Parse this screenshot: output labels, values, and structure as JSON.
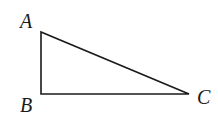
{
  "diagram": {
    "type": "right-triangle",
    "stroke_color": "#1a1a1a",
    "vertices": [
      {
        "id": "A",
        "label": "A",
        "x": 41,
        "y": 32,
        "label_x": 20,
        "label_y": 28
      },
      {
        "id": "B",
        "label": "B",
        "x": 41,
        "y": 94,
        "label_x": 20,
        "label_y": 112
      },
      {
        "id": "C",
        "label": "C",
        "x": 189,
        "y": 94,
        "label_x": 197,
        "label_y": 104
      }
    ],
    "edges": [
      {
        "from": "A",
        "to": "B"
      },
      {
        "from": "B",
        "to": "C"
      },
      {
        "from": "C",
        "to": "A"
      }
    ]
  }
}
